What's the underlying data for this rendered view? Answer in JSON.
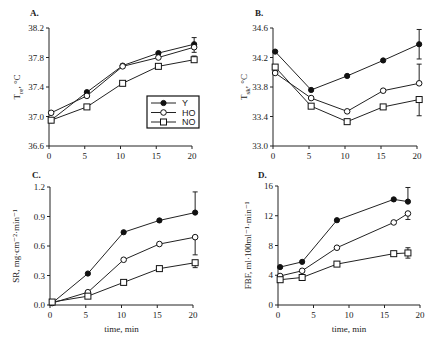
{
  "chart_data": [
    {
      "id": "A",
      "type": "line",
      "panel_label": "A.",
      "title": "",
      "xlabel": "",
      "ylabel": "T_re, °C",
      "ylabel_main": "T",
      "ylabel_sub": "re",
      "ylabel_rest": ", °C",
      "xlim": [
        0,
        20
      ],
      "ylim": [
        36.6,
        38.2
      ],
      "xticks": [
        0,
        5,
        10,
        15,
        20
      ],
      "yticks": [
        36.6,
        37.0,
        37.4,
        37.8,
        38.2
      ],
      "ytick_labels": [
        "36.6",
        "37.0",
        "37.4",
        "37.8",
        "38.2"
      ],
      "grid": false,
      "legend_position": "center-right",
      "series": [
        {
          "name": "Y",
          "marker": "filled-circle",
          "x": [
            0.3,
            5.3,
            10.3,
            15.3,
            20.3
          ],
          "values": [
            36.95,
            37.33,
            37.69,
            37.86,
            37.98
          ],
          "error": {
            "index": 4,
            "up": 0.09,
            "down": 0
          }
        },
        {
          "name": "HO",
          "marker": "open-circle",
          "x": [
            0.3,
            5.3,
            10.3,
            15.3,
            20.3
          ],
          "values": [
            37.05,
            37.28,
            37.68,
            37.8,
            37.94
          ],
          "error": {
            "index": 4,
            "up": 0,
            "down": 0.07
          }
        },
        {
          "name": "NO",
          "marker": "open-square",
          "x": [
            0.3,
            5.3,
            10.3,
            15.3,
            20.3
          ],
          "values": [
            36.95,
            37.13,
            37.45,
            37.68,
            37.77
          ],
          "error": {
            "index": 4,
            "up": 0.05,
            "down": 0
          }
        }
      ]
    },
    {
      "id": "B",
      "type": "line",
      "panel_label": "B.",
      "title": "",
      "xlabel": "",
      "ylabel": "T_sk, °C",
      "ylabel_main": "T",
      "ylabel_sub": "sk",
      "ylabel_rest": ", °C",
      "xlim": [
        0,
        20
      ],
      "ylim": [
        33.0,
        34.6
      ],
      "xticks": [
        0,
        5,
        10,
        15,
        20
      ],
      "yticks": [
        33.0,
        33.4,
        33.8,
        34.2,
        34.6
      ],
      "ytick_labels": [
        "33.0",
        "33.4",
        "33.8",
        "34.2",
        "34.6"
      ],
      "grid": false,
      "series": [
        {
          "name": "Y",
          "marker": "filled-circle",
          "x": [
            0.3,
            5.3,
            10.3,
            15.3,
            20.3
          ],
          "values": [
            34.28,
            33.76,
            33.95,
            34.16,
            34.38
          ],
          "error": {
            "index": 4,
            "up": 0.2,
            "down": 0.2
          }
        },
        {
          "name": "HO",
          "marker": "open-circle",
          "x": [
            0.3,
            5.3,
            10.3,
            15.3,
            20.3
          ],
          "values": [
            33.99,
            33.65,
            33.47,
            33.75,
            33.85
          ],
          "error": {
            "index": 4,
            "up": 0.26,
            "down": 0
          }
        },
        {
          "name": "NO",
          "marker": "open-square",
          "x": [
            0.3,
            5.3,
            10.3,
            15.3,
            20.3
          ],
          "values": [
            34.07,
            33.54,
            33.33,
            33.53,
            33.63
          ],
          "error": {
            "index": 4,
            "up": 0,
            "down": 0.22
          }
        }
      ]
    },
    {
      "id": "C",
      "type": "line",
      "panel_label": "C.",
      "title": "",
      "xlabel": "time, min",
      "ylabel": "SR, mg·cm⁻²·min⁻¹",
      "xlim": [
        0,
        20
      ],
      "ylim": [
        0.0,
        1.2
      ],
      "xticks": [
        0,
        5,
        10,
        15,
        20
      ],
      "yticks": [
        0.0,
        0.3,
        0.6,
        0.9,
        1.2
      ],
      "ytick_labels": [
        "0.0",
        "0.3",
        "0.6",
        "0.9",
        "1.2"
      ],
      "grid": false,
      "series": [
        {
          "name": "Y",
          "marker": "filled-circle",
          "x": [
            0.3,
            5.3,
            10.3,
            15.3,
            20.3
          ],
          "values": [
            0.02,
            0.32,
            0.74,
            0.86,
            0.94
          ],
          "error": {
            "index": 4,
            "up": 0.21,
            "down": 0
          }
        },
        {
          "name": "HO",
          "marker": "open-circle",
          "x": [
            0.3,
            5.3,
            10.3,
            15.3,
            20.3
          ],
          "values": [
            0.02,
            0.13,
            0.46,
            0.62,
            0.69
          ],
          "error": {
            "index": 4,
            "up": 0,
            "down": 0.18
          }
        },
        {
          "name": "NO",
          "marker": "open-square",
          "x": [
            0.3,
            5.3,
            10.3,
            15.3,
            20.3
          ],
          "values": [
            0.03,
            0.09,
            0.23,
            0.37,
            0.43
          ],
          "error": {
            "index": 4,
            "up": 0,
            "down": 0.05
          }
        }
      ]
    },
    {
      "id": "D",
      "type": "line",
      "panel_label": "D.",
      "title": "",
      "xlabel": "time, min",
      "ylabel": "FBF, ml·100ml⁻¹·min⁻¹",
      "xlim": [
        0,
        20
      ],
      "ylim": [
        0,
        16
      ],
      "xticks": [
        0,
        5,
        10,
        15,
        20
      ],
      "yticks": [
        0,
        4,
        8,
        12,
        16
      ],
      "ytick_labels": [
        "0",
        "4",
        "8",
        "12",
        "16"
      ],
      "grid": false,
      "series": [
        {
          "name": "Y",
          "marker": "filled-circle",
          "x": [
            0.3,
            3.4,
            8.3,
            16.3,
            18.3
          ],
          "values": [
            5.1,
            5.8,
            11.4,
            14.2,
            13.9
          ],
          "error": {
            "index": 4,
            "up": 1.9,
            "down": 0
          }
        },
        {
          "name": "HO",
          "marker": "open-circle",
          "x": [
            0.3,
            3.4,
            8.3,
            16.3,
            18.3
          ],
          "values": [
            3.9,
            4.6,
            7.7,
            11.1,
            12.3
          ],
          "error": {
            "index": 4,
            "up": 0,
            "down": 0.8
          }
        },
        {
          "name": "NO",
          "marker": "open-square",
          "x": [
            0.3,
            3.4,
            8.3,
            16.3,
            18.3
          ],
          "values": [
            3.4,
            3.7,
            5.5,
            6.9,
            7.0
          ],
          "error": {
            "index": 4,
            "up": 0.7,
            "down": 0.7
          }
        }
      ]
    }
  ],
  "legend": {
    "entries": [
      {
        "name": "Y",
        "marker": "filled-circle"
      },
      {
        "name": "HO",
        "marker": "open-circle"
      },
      {
        "name": "NO",
        "marker": "open-square"
      }
    ]
  }
}
